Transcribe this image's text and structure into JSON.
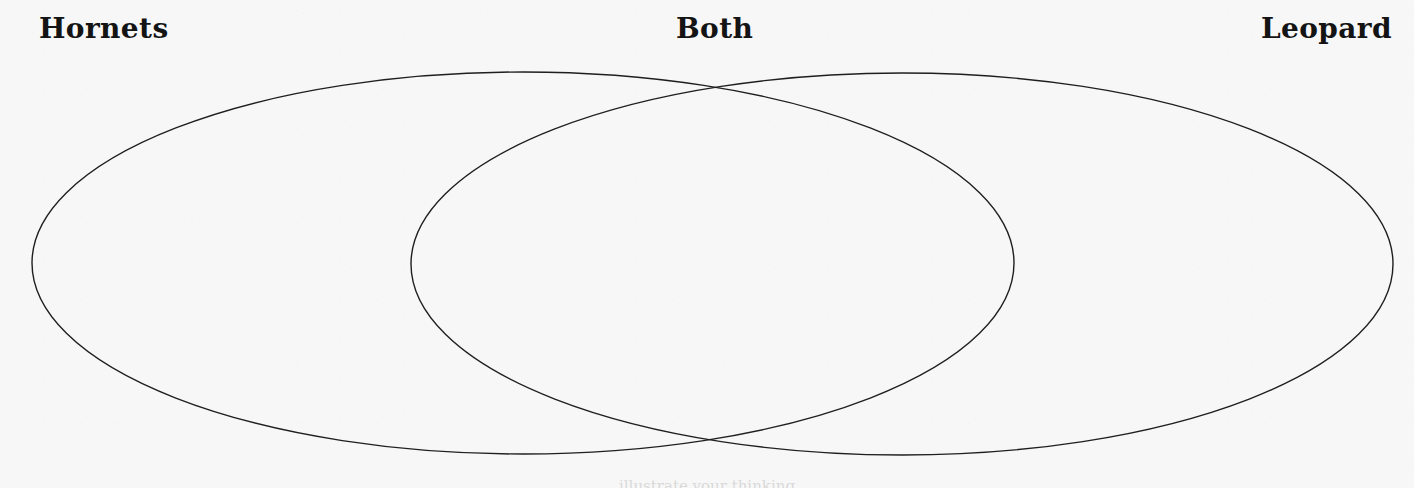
{
  "page": {
    "type": "venn-diagram-worksheet",
    "background_color": "#f7f7f7",
    "width": 1414,
    "height": 488
  },
  "labels": {
    "left": "Hornets",
    "center": "Both",
    "right": "Leopard"
  },
  "footer": {
    "cut_off_text": "illustrate your thinking"
  },
  "diagram": {
    "stroke_color": "#1f1f1f",
    "fill_color": "none",
    "stroke_width": 1.4,
    "left_circle": {
      "name": "Hornets",
      "cx": 523,
      "cy": 263,
      "rx": 491,
      "ry": 191
    },
    "right_circle": {
      "name": "Leopard",
      "cx": 902,
      "cy": 264,
      "rx": 491,
      "ry": 191
    },
    "intersection_label": "Both",
    "intersection_top_point": {
      "x": 718,
      "y": 87
    },
    "intersection_bottom_point": {
      "x": 709,
      "y": 442
    }
  }
}
